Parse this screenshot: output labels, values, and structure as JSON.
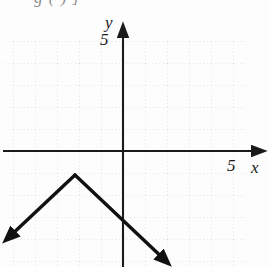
{
  "figure": {
    "clipped_header_text": "g    (      )     ]",
    "background_color": "#fdfdfd",
    "width": 269,
    "height": 267
  },
  "axes": {
    "x_label": "x",
    "y_label": "y",
    "x_tick_label": "5",
    "y_tick_label": "5",
    "axis_color": "#1a1a1a",
    "origin_px": {
      "x": 123,
      "y": 151
    },
    "unit_px": 22,
    "x_axis_y_px": 151,
    "y_axis_x_px": 123,
    "x_arrow_tip_px": {
      "x": 259,
      "y": 151
    },
    "y_arrow_tip_px": {
      "x": 123,
      "y": 30
    }
  },
  "grid": {
    "style": "dotted",
    "color": "#cfcfcf",
    "spacing_px": 22,
    "visible": true,
    "left_px": 5,
    "right_px": 245,
    "top_px": 38,
    "bottom_px": 267
  },
  "chart_data": {
    "type": "line",
    "title": "",
    "xlabel": "x",
    "ylabel": "y",
    "xlim": [
      -5.4,
      6.2
    ],
    "ylim": [
      -5.3,
      5.5
    ],
    "grid": true,
    "legend": false,
    "curve_color": "#111111",
    "curve_width_px": 3.4,
    "vertex": {
      "x": -2.2,
      "y": -1.1
    },
    "series": [
      {
        "name": "inverted-absolute-value",
        "points": [
          {
            "x": -5.3,
            "y": -4.0
          },
          {
            "x": -2.2,
            "y": -1.1
          },
          {
            "x": 2.0,
            "y": -5.1
          }
        ],
        "pixel_points": [
          {
            "x": 6,
            "y": 240
          },
          {
            "x": 75,
            "y": 175
          },
          {
            "x": 168,
            "y": 263
          }
        ],
        "arrow_start": true,
        "arrow_end": true
      }
    ]
  }
}
